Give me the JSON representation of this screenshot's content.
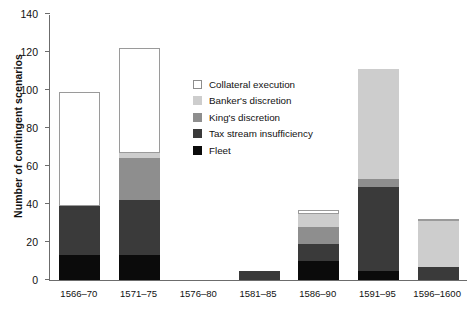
{
  "chart_data": {
    "type": "bar",
    "stacked": true,
    "title": "",
    "xlabel": "",
    "ylabel": "Number of contingent scenarios",
    "ylim": [
      0,
      140
    ],
    "yticks": [
      0,
      20,
      40,
      60,
      80,
      100,
      120,
      140
    ],
    "grid": false,
    "legend_position": "inside-upper-center",
    "categories": [
      "1566–70",
      "1571–75",
      "1576–80",
      "1581–85",
      "1586–90",
      "1591–95",
      "1596–1600"
    ],
    "series": [
      {
        "name": "Fleet",
        "color": "#0b0b0b",
        "values": [
          13,
          13,
          0,
          0,
          10,
          5,
          0
        ]
      },
      {
        "name": "Tax stream insufficiency",
        "color": "#3a3a3a",
        "values": [
          26,
          29,
          0,
          5,
          9,
          44,
          7
        ]
      },
      {
        "name": "King's discretion",
        "color": "#8e8e8e",
        "values": [
          0,
          22,
          0,
          0,
          9,
          4,
          0
        ]
      },
      {
        "name": "Banker's discretion",
        "color": "#cdcdcd",
        "values": [
          0,
          3,
          0,
          0,
          7,
          58,
          24
        ]
      },
      {
        "name": "Collateral execution",
        "color": "#ffffff",
        "values": [
          60,
          55,
          0,
          0,
          2,
          0,
          1
        ]
      }
    ],
    "totals": [
      99,
      122,
      0,
      5,
      37,
      111,
      32
    ]
  },
  "axes": {
    "y": {
      "label": "Number of contingent scenarios",
      "ticks": [
        "0",
        "20",
        "40",
        "60",
        "80",
        "100",
        "120",
        "140"
      ]
    },
    "x": {
      "ticks": [
        "1566–70",
        "1571–75",
        "1576–80",
        "1581–85",
        "1586–90",
        "1591–95",
        "1596–1600"
      ]
    }
  },
  "legend": {
    "items": [
      {
        "label": "Collateral execution",
        "swatch": "collateral"
      },
      {
        "label": "Banker's discretion",
        "swatch": "banker"
      },
      {
        "label": "King's discretion",
        "swatch": "king"
      },
      {
        "label": "Tax stream insufficiency",
        "swatch": "tax"
      },
      {
        "label": "Fleet",
        "swatch": "fleet"
      }
    ]
  }
}
